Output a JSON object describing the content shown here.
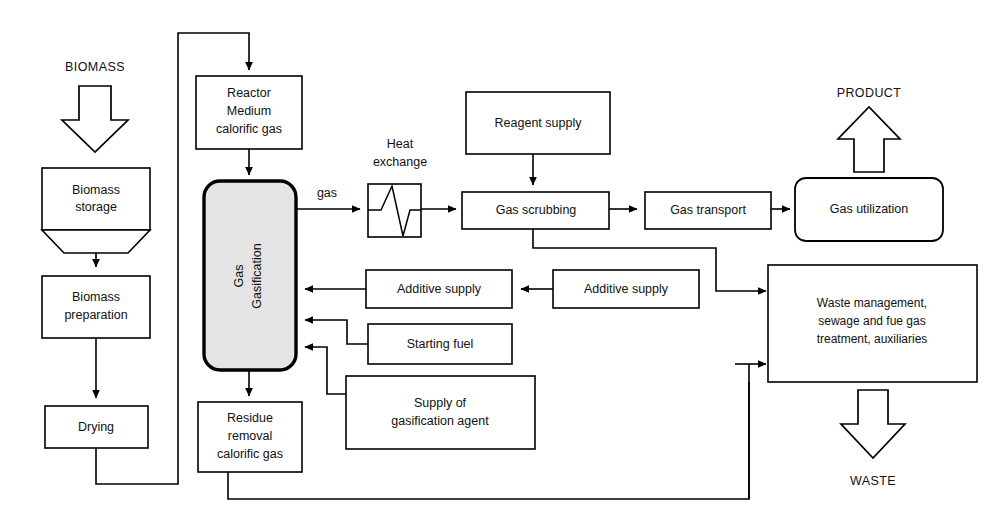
{
  "diagram": {
    "colors": {
      "background": "#ffffff",
      "stroke": "#000000",
      "gasifier_fill": "#e4e4e4",
      "box_fill": "#ffffff"
    }
  },
  "io_labels": {
    "biomass": "BIOMASS",
    "product": "PRODUCT",
    "waste": "WASTE"
  },
  "edge_labels": {
    "gas": "gas",
    "heat_exchange": "Heat\nexchange",
    "heat_exchange_line1": "Heat",
    "heat_exchange_line2": "exchange"
  },
  "nodes": {
    "biomass_storage": {
      "name": "biomass-storage",
      "lines": [
        "Biomass",
        "storage"
      ]
    },
    "biomass_preparation": {
      "name": "biomass-preparation",
      "lines": [
        "Biomass",
        "preparation"
      ]
    },
    "drying": {
      "name": "drying",
      "lines": [
        "Drying"
      ]
    },
    "reactor": {
      "name": "reactor-medium-calorific-gas",
      "lines": [
        "Reactor",
        "Medium",
        "calorific gas"
      ]
    },
    "gasification": {
      "name": "gas-gasification",
      "lines": [
        "Gas",
        "Gasification"
      ]
    },
    "residue_removal": {
      "name": "residue-removal-calorific-gas",
      "lines": [
        "Residue",
        "removal",
        "calorific gas"
      ]
    },
    "heat_exchanger": {
      "name": "heat-exchanger",
      "lines": []
    },
    "reagent_supply": {
      "name": "reagent-supply",
      "lines": [
        "Reagent supply"
      ]
    },
    "gas_scrubbing": {
      "name": "gas-scrubbing",
      "lines": [
        "Gas scrubbing"
      ]
    },
    "gas_transport": {
      "name": "gas-transport",
      "lines": [
        "Gas transport"
      ]
    },
    "gas_utilization": {
      "name": "gas-utilization",
      "lines": [
        "Gas utilization"
      ]
    },
    "additive_supply_left": {
      "name": "additive-supply-left",
      "lines": [
        "Additive supply"
      ]
    },
    "additive_supply_right": {
      "name": "additive-supply-right",
      "lines": [
        "Additive supply"
      ]
    },
    "starting_fuel": {
      "name": "starting-fuel",
      "lines": [
        "Starting fuel"
      ]
    },
    "gasification_agent_supply": {
      "name": "supply-of-gasification-agent",
      "lines": [
        "Supply of",
        "gasification agent"
      ]
    },
    "waste_management": {
      "name": "waste-management",
      "lines": [
        "Waste management,",
        "sewage and fue gas",
        "treatment, auxiliaries"
      ]
    }
  }
}
